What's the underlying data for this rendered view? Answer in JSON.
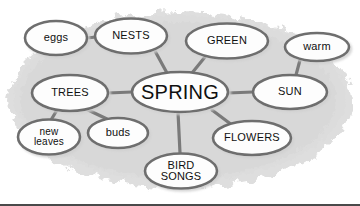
{
  "diagram": {
    "type": "concept-web",
    "title": "SPRING",
    "background_blob_color": "#dcdcdc",
    "node_fill_color": "#fdfdfd",
    "node_stroke_color": "#6e6e6e",
    "connector_color": "#7a7a7a",
    "text_color": "#101010",
    "center": {
      "id": "spring",
      "label": "SPRING",
      "cx": 180,
      "cy": 92,
      "rx": 48,
      "ry": 20,
      "font_size": 20
    },
    "nodes": [
      {
        "id": "eggs",
        "label": "eggs",
        "cx": 56,
        "cy": 38,
        "rx": 31,
        "ry": 17,
        "font_size": 11
      },
      {
        "id": "nests",
        "label": "NESTS",
        "cx": 131,
        "cy": 36,
        "rx": 36,
        "ry": 17.5,
        "font_size": 11
      },
      {
        "id": "green",
        "label": "GREEN",
        "cx": 227,
        "cy": 41,
        "rx": 41,
        "ry": 17.5,
        "font_size": 11
      },
      {
        "id": "warm",
        "label": "warm",
        "cx": 317,
        "cy": 47,
        "rx": 32,
        "ry": 14,
        "font_size": 11
      },
      {
        "id": "trees",
        "label": "TREES",
        "cx": 70,
        "cy": 93,
        "rx": 38,
        "ry": 18,
        "font_size": 11
      },
      {
        "id": "sun",
        "label": "SUN",
        "cx": 290,
        "cy": 92,
        "rx": 37,
        "ry": 17,
        "font_size": 11
      },
      {
        "id": "new-leaves",
        "label": "new\nleaves",
        "cx": 49,
        "cy": 137,
        "rx": 31,
        "ry": 17.5,
        "font_size": 10
      },
      {
        "id": "buds",
        "label": "buds",
        "cx": 118,
        "cy": 133,
        "rx": 30,
        "ry": 15,
        "font_size": 11
      },
      {
        "id": "flowers",
        "label": "FLOWERS",
        "cx": 252,
        "cy": 138,
        "rx": 39,
        "ry": 17,
        "font_size": 11
      },
      {
        "id": "bird-songs",
        "label": "BIRD\nSONGS",
        "cx": 181,
        "cy": 171,
        "rx": 36,
        "ry": 17.5,
        "font_size": 11
      }
    ],
    "edges": [
      {
        "from": "eggs",
        "to": "nests",
        "x1": 87,
        "y1": 38,
        "x2": 96,
        "y2": 37
      },
      {
        "from": "nests",
        "to": "spring",
        "x1": 155,
        "y1": 51,
        "x2": 167,
        "y2": 73
      },
      {
        "from": "green",
        "to": "spring",
        "x1": 205,
        "y1": 57,
        "x2": 192,
        "y2": 73
      },
      {
        "from": "warm",
        "to": "sun",
        "x1": 300,
        "y1": 60,
        "x2": 296,
        "y2": 75
      },
      {
        "from": "trees",
        "to": "spring",
        "x1": 108,
        "y1": 93,
        "x2": 132,
        "y2": 92
      },
      {
        "from": "spring",
        "to": "sun",
        "x1": 228,
        "y1": 93,
        "x2": 253,
        "y2": 92
      },
      {
        "from": "trees",
        "to": "new-leaves",
        "x1": 57,
        "y1": 110,
        "x2": 51,
        "y2": 120
      },
      {
        "from": "trees",
        "to": "buds",
        "x1": 86,
        "y1": 109,
        "x2": 107,
        "y2": 119
      },
      {
        "from": "spring",
        "to": "bird-songs",
        "x1": 178,
        "y1": 112,
        "x2": 180,
        "y2": 153
      },
      {
        "from": "spring",
        "to": "flowers",
        "x1": 212,
        "y1": 110,
        "x2": 232,
        "y2": 125
      }
    ]
  }
}
